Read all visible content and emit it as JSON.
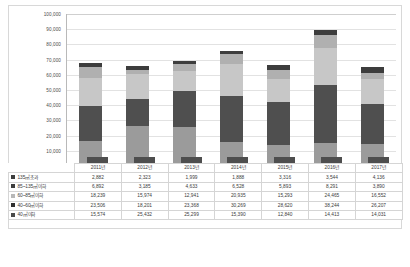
{
  "chart_data": {
    "type": "bar",
    "stacked": true,
    "title": "",
    "xlabel": "",
    "ylabel": "",
    "ylim": [
      0,
      100000
    ],
    "y_ticks": [
      "10,000",
      "20,000",
      "30,000",
      "40,000",
      "50,000",
      "60,000",
      "70,000",
      "80,000",
      "90,000",
      "100,000"
    ],
    "y_tick_values": [
      10000,
      20000,
      30000,
      40000,
      50000,
      60000,
      70000,
      80000,
      90000,
      100000
    ],
    "grid": true,
    "legend_position": "table-left",
    "categories": [
      "2011년",
      "2012년",
      "2013년",
      "2014년",
      "2015년",
      "2016년",
      "2017년"
    ],
    "series": [
      {
        "name": "40㎡이하",
        "color": "#9b9b9b",
        "values": [
          15574,
          25432,
          25299,
          15390,
          12840,
          14413,
          14031
        ],
        "values_text": [
          "15,574",
          "25,432",
          "25,299",
          "15,390",
          "12,840",
          "14,413",
          "14,031"
        ]
      },
      {
        "name": "40~60㎡이하",
        "color": "#4f4f4f",
        "values": [
          23506,
          18201,
          23368,
          30269,
          28620,
          38244,
          26207
        ],
        "values_text": [
          "23,506",
          "18,201",
          "23,368",
          "30,269",
          "28,620",
          "38,244",
          "26,207"
        ]
      },
      {
        "name": "60~85㎡이하",
        "color": "#c7c7c7",
        "values": [
          18239,
          15974,
          12941,
          20935,
          15293,
          24465,
          16552
        ],
        "values_text": [
          "18,239",
          "15,974",
          "12,941",
          "20,935",
          "15,293",
          "24,465",
          "16,552"
        ]
      },
      {
        "name": "85~135㎡이하",
        "color": "#b0b0b0",
        "values": [
          6892,
          3185,
          4633,
          6528,
          5893,
          8291,
          3890
        ],
        "values_text": [
          "6,892",
          "3,185",
          "4,633",
          "6,528",
          "5,893",
          "8,291",
          "3,890"
        ]
      },
      {
        "name": "135㎡초과",
        "color": "#3d3d3d",
        "values": [
          2882,
          2323,
          1999,
          1888,
          3316,
          3544,
          4136
        ],
        "values_text": [
          "2,882",
          "2,323",
          "1,999",
          "1,888",
          "3,316",
          "3,544",
          "4,136"
        ]
      }
    ]
  },
  "table": {
    "header_blank": "",
    "columns": [
      "2011년",
      "2012년",
      "2013년",
      "2014년",
      "2015년",
      "2016년",
      "2017년"
    ],
    "rows": [
      {
        "label": "135㎡초과",
        "color": "#3d3d3d",
        "cells": [
          "2,882",
          "2,323",
          "1,999",
          "1,888",
          "3,316",
          "3,544",
          "4,136"
        ]
      },
      {
        "label": "85~135㎡이하",
        "color": "#3d3d3d",
        "cells": [
          "6,892",
          "3,185",
          "4,633",
          "6,528",
          "5,893",
          "8,291",
          "3,890"
        ]
      },
      {
        "label": "60~85㎡이하",
        "color": "#b8b8b8",
        "cells": [
          "18,239",
          "15,974",
          "12,941",
          "20,935",
          "15,293",
          "24,465",
          "16,552"
        ]
      },
      {
        "label": "40~60㎡이하",
        "color": "#2f2f2f",
        "cells": [
          "23,506",
          "18,201",
          "23,368",
          "30,269",
          "28,620",
          "38,244",
          "26,207"
        ]
      },
      {
        "label": "40㎡이하",
        "color": "#4a4a4a",
        "cells": [
          "15,574",
          "25,432",
          "25,299",
          "15,390",
          "12,840",
          "14,413",
          "14,031"
        ]
      }
    ]
  }
}
